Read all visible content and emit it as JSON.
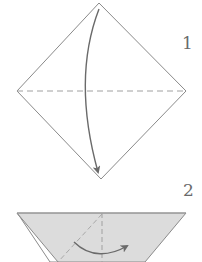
{
  "diagram": {
    "type": "origami-instructions",
    "colors": {
      "line": "#8a8a8a",
      "arrow": "#6a6a6a",
      "paper_colored": "#dcdcdc",
      "paper_white": "#ffffff",
      "crease_dash": "#a0a0a0"
    },
    "steps": [
      {
        "number": "1",
        "shape": "square rotated as diamond",
        "crease": "horizontal dashed valley fold line",
        "action": "fold top corner down to bottom corner (curved arrow)"
      },
      {
        "number": "2",
        "shape": "triangle (colored side up) with white edge showing at left",
        "crease": "vertical dashed center line and diagonal fold line",
        "action": "curved arrow from left to right"
      }
    ]
  }
}
